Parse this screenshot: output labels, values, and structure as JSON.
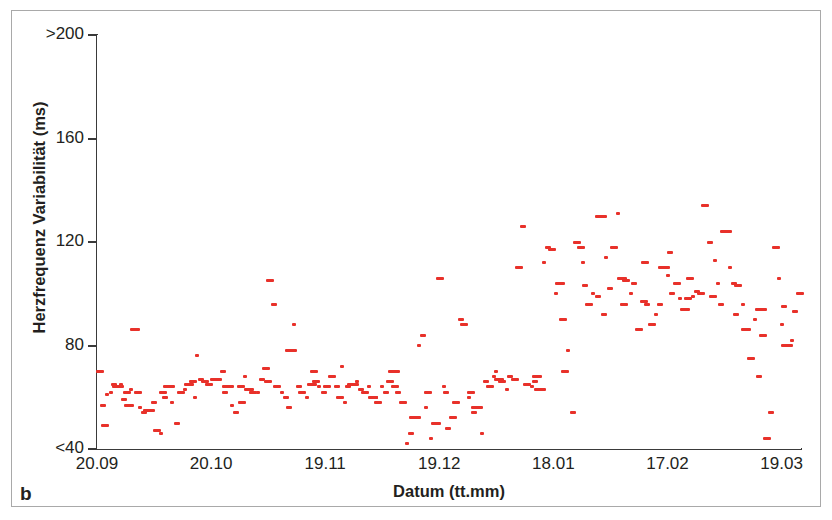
{
  "panel": {
    "label": "b"
  },
  "axes": {
    "y_title": "Herzfrequenz Variabilität (ms)",
    "x_title": "Datum (tt.mm)",
    "y_ticks": [
      {
        "label": ">200",
        "value": 200
      },
      {
        "label": "160",
        "value": 160
      },
      {
        "label": "120",
        "value": 120
      },
      {
        "label": "80",
        "value": 80
      },
      {
        "label": "<40",
        "value": 40
      }
    ],
    "x_ticks": [
      {
        "label": "20.09",
        "index": 0
      },
      {
        "label": "20.10",
        "index": 1
      },
      {
        "label": "19.11",
        "index": 2
      },
      {
        "label": "19.12",
        "index": 3
      },
      {
        "label": "18.01",
        "index": 4
      },
      {
        "label": "17.02",
        "index": 5
      },
      {
        "label": "19.03",
        "index": 6
      }
    ]
  },
  "style": {
    "marker_color": "#e8312a",
    "axis_color": "#3a3a3a",
    "frame_color": "#a9a9a9",
    "text_color": "#231f20",
    "background": "#ffffff"
  },
  "chart_data": {
    "type": "scatter",
    "title": "",
    "xlabel": "Datum (tt.mm)",
    "ylabel": "Herzfrequenz Variabilität (ms)",
    "xlim": [
      0,
      6.17
    ],
    "ylim": [
      40,
      200
    ],
    "grid": false,
    "legend": null,
    "x_tick_labels": [
      "20.09",
      "20.10",
      "19.11",
      "19.12",
      "18.01",
      "17.02",
      "19.03"
    ],
    "x_tick_positions": [
      0,
      1,
      2,
      3,
      4,
      5,
      6
    ],
    "y_tick_labels": [
      ">200",
      "160",
      "120",
      "80",
      "<40"
    ],
    "y_tick_values": [
      200,
      160,
      120,
      80,
      40
    ],
    "marker": "horizontal-dash",
    "color": "#e8312a",
    "series": [
      {
        "name": "Herzfrequenz Variabilität",
        "points": [
          [
            0.03,
            70
          ],
          [
            0.05,
            57
          ],
          [
            0.07,
            49
          ],
          [
            0.12,
            62
          ],
          [
            0.15,
            65
          ],
          [
            0.18,
            64
          ],
          [
            0.21,
            65
          ],
          [
            0.24,
            59
          ],
          [
            0.26,
            62
          ],
          [
            0.3,
            63
          ],
          [
            0.33,
            86
          ],
          [
            0.36,
            62
          ],
          [
            0.38,
            56
          ],
          [
            0.41,
            54
          ],
          [
            0.44,
            55
          ],
          [
            0.47,
            55
          ],
          [
            0.5,
            58
          ],
          [
            0.53,
            47
          ],
          [
            0.56,
            46
          ],
          [
            0.6,
            60
          ],
          [
            0.63,
            64
          ],
          [
            0.66,
            58
          ],
          [
            0.7,
            50
          ],
          [
            0.74,
            62
          ],
          [
            0.77,
            63
          ],
          [
            0.81,
            65
          ],
          [
            0.84,
            66
          ],
          [
            0.88,
            76
          ],
          [
            0.91,
            67
          ],
          [
            0.95,
            66
          ],
          [
            0.98,
            65
          ],
          [
            1.02,
            67
          ],
          [
            1.05,
            67
          ],
          [
            1.08,
            67
          ],
          [
            1.12,
            62
          ],
          [
            1.15,
            64
          ],
          [
            1.18,
            57
          ],
          [
            1.22,
            54
          ],
          [
            1.26,
            64
          ],
          [
            1.3,
            68
          ],
          [
            1.33,
            63
          ],
          [
            1.37,
            62
          ],
          [
            1.41,
            62
          ],
          [
            1.45,
            67
          ],
          [
            1.48,
            71
          ],
          [
            1.52,
            105
          ],
          [
            1.55,
            96
          ],
          [
            1.58,
            64
          ],
          [
            1.62,
            62
          ],
          [
            1.66,
            60
          ],
          [
            1.7,
            78
          ],
          [
            1.73,
            88
          ],
          [
            1.77,
            64
          ],
          [
            1.8,
            62
          ],
          [
            1.84,
            60
          ],
          [
            1.88,
            65
          ],
          [
            1.92,
            66
          ],
          [
            1.95,
            64
          ],
          [
            1.99,
            62
          ],
          [
            2.02,
            64
          ],
          [
            2.06,
            68
          ],
          [
            2.1,
            64
          ],
          [
            2.13,
            60
          ],
          [
            2.17,
            58
          ],
          [
            2.2,
            64
          ],
          [
            2.24,
            65
          ],
          [
            2.28,
            66
          ],
          [
            2.31,
            63
          ],
          [
            2.35,
            62
          ],
          [
            2.38,
            64
          ],
          [
            2.42,
            60
          ],
          [
            2.46,
            58
          ],
          [
            2.5,
            64
          ],
          [
            2.53,
            62
          ],
          [
            2.57,
            66
          ],
          [
            2.61,
            64
          ],
          [
            2.64,
            62
          ],
          [
            2.68,
            58
          ],
          [
            2.72,
            42
          ],
          [
            2.75,
            46
          ],
          [
            2.79,
            52
          ],
          [
            2.82,
            80
          ],
          [
            2.86,
            84
          ],
          [
            2.9,
            62
          ],
          [
            2.93,
            44
          ],
          [
            2.97,
            50
          ],
          [
            3.01,
            106
          ],
          [
            3.04,
            64
          ],
          [
            3.08,
            48
          ],
          [
            3.12,
            52
          ],
          [
            3.15,
            58
          ],
          [
            3.19,
            90
          ],
          [
            3.22,
            88
          ],
          [
            3.26,
            60
          ],
          [
            3.3,
            54
          ],
          [
            3.33,
            56
          ],
          [
            3.37,
            46
          ],
          [
            3.41,
            66
          ],
          [
            3.44,
            64
          ],
          [
            3.48,
            68
          ],
          [
            3.52,
            67
          ],
          [
            3.55,
            66
          ],
          [
            3.59,
            63
          ],
          [
            3.62,
            68
          ],
          [
            3.66,
            67
          ],
          [
            3.7,
            110
          ],
          [
            3.73,
            126
          ],
          [
            3.77,
            65
          ],
          [
            3.81,
            64
          ],
          [
            3.84,
            66
          ],
          [
            3.88,
            63
          ],
          [
            3.92,
            112
          ],
          [
            3.95,
            118
          ],
          [
            3.99,
            117
          ],
          [
            4.02,
            100
          ],
          [
            4.06,
            104
          ],
          [
            4.1,
            70
          ],
          [
            4.13,
            78
          ],
          [
            4.17,
            54
          ],
          [
            4.21,
            120
          ],
          [
            4.24,
            118
          ],
          [
            4.28,
            103
          ],
          [
            4.31,
            96
          ],
          [
            4.35,
            100
          ],
          [
            4.39,
            99
          ],
          [
            4.42,
            130
          ],
          [
            4.46,
            114
          ],
          [
            4.5,
            102
          ],
          [
            4.53,
            118
          ],
          [
            4.57,
            131
          ],
          [
            4.6,
            106
          ],
          [
            4.64,
            105
          ],
          [
            4.68,
            100
          ],
          [
            4.71,
            104
          ],
          [
            4.75,
            86
          ],
          [
            4.79,
            97
          ],
          [
            4.82,
            96
          ],
          [
            4.86,
            88
          ],
          [
            4.9,
            92
          ],
          [
            4.93,
            96
          ],
          [
            4.97,
            110
          ],
          [
            5.0,
            107
          ],
          [
            5.04,
            100
          ],
          [
            5.08,
            104
          ],
          [
            5.11,
            98
          ],
          [
            5.15,
            94
          ],
          [
            5.18,
            98
          ],
          [
            5.22,
            99
          ],
          [
            5.26,
            101
          ],
          [
            5.29,
            100
          ],
          [
            5.33,
            134
          ],
          [
            5.37,
            120
          ],
          [
            5.4,
            99
          ],
          [
            5.44,
            104
          ],
          [
            5.47,
            96
          ],
          [
            5.51,
            124
          ],
          [
            5.55,
            110
          ],
          [
            5.58,
            104
          ],
          [
            5.62,
            103
          ],
          [
            5.66,
            96
          ],
          [
            5.69,
            86
          ],
          [
            5.73,
            75
          ],
          [
            5.77,
            90
          ],
          [
            5.8,
            68
          ],
          [
            5.84,
            84
          ],
          [
            5.87,
            44
          ],
          [
            5.91,
            54
          ],
          [
            5.95,
            118
          ],
          [
            5.98,
            106
          ],
          [
            6.02,
            95
          ],
          [
            6.05,
            80
          ],
          [
            6.09,
            82
          ],
          [
            6.12,
            93
          ],
          [
            6.16,
            100
          ],
          [
            0.09,
            61
          ],
          [
            0.28,
            57
          ],
          [
            0.58,
            62
          ],
          [
            0.86,
            60
          ],
          [
            1.1,
            70
          ],
          [
            1.27,
            58
          ],
          [
            1.5,
            66
          ],
          [
            1.68,
            56
          ],
          [
            1.9,
            70
          ],
          [
            2.15,
            72
          ],
          [
            2.44,
            60
          ],
          [
            2.6,
            70
          ],
          [
            2.88,
            56
          ],
          [
            3.06,
            62
          ],
          [
            3.28,
            62
          ],
          [
            3.5,
            70
          ],
          [
            3.86,
            68
          ],
          [
            4.08,
            90
          ],
          [
            4.26,
            112
          ],
          [
            4.44,
            92
          ],
          [
            4.62,
            96
          ],
          [
            4.8,
            112
          ],
          [
            5.02,
            116
          ],
          [
            5.2,
            106
          ],
          [
            5.42,
            113
          ],
          [
            5.6,
            92
          ],
          [
            5.82,
            94
          ],
          [
            6.0,
            88
          ]
        ]
      }
    ]
  }
}
